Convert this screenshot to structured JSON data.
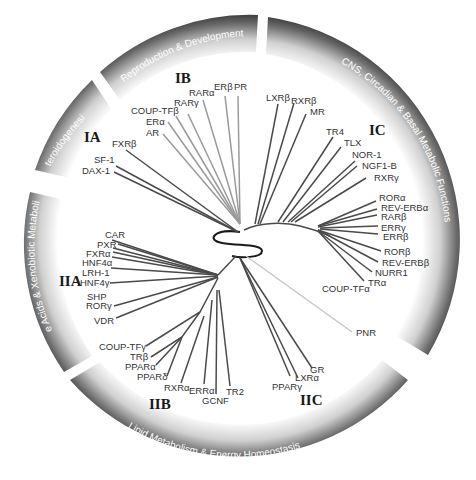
{
  "diagram": {
    "type": "phylogenetic-tree",
    "bands": [
      {
        "id": "steroidogenesis",
        "label": "Steroidogenesis"
      },
      {
        "id": "reproduction",
        "label": "Reproduction & Development"
      },
      {
        "id": "cns",
        "label": "CNS, Circadian & Basal Metabolic Functions"
      },
      {
        "id": "lipid",
        "label": "Lipid Metabolism & Energy Homeostasis"
      },
      {
        "id": "bile",
        "label": "Bile Acids & Xenobiotic Metabolism"
      }
    ],
    "clades": [
      {
        "id": "IA",
        "label": "IA"
      },
      {
        "id": "IB",
        "label": "IB"
      },
      {
        "id": "IC",
        "label": "IC"
      },
      {
        "id": "IIA",
        "label": "IIA"
      },
      {
        "id": "IIB",
        "label": "IIB"
      },
      {
        "id": "IIC",
        "label": "IIC"
      }
    ],
    "leaves": {
      "IA": [
        "FXRβ",
        "SF-1",
        "DAX-1"
      ],
      "IB": [
        "RARα",
        "ERβ",
        "PR",
        "RARγ",
        "COUP-TFβ",
        "ERα",
        "AR"
      ],
      "IC": [
        "LXRβ",
        "RXRβ",
        "MR",
        "TR4",
        "TLX",
        "NOR-1",
        "NGF1-B",
        "RXRγ",
        "RORα",
        "REV-ERBα",
        "RARβ",
        "ERRγ",
        "ERRβ",
        "RORβ",
        "REV-ERBβ",
        "NURR1",
        "TRα",
        "COUP-TFα"
      ],
      "IIA": [
        "CAR",
        "PXR",
        "FXRα",
        "HNF4α",
        "LRH-1",
        "HNF4γ",
        "SHP",
        "RORγ",
        "VDR"
      ],
      "IIB": [
        "COUP-TFγ",
        "TRβ",
        "PPARα",
        "PPARδ",
        "RXRα",
        "ERRα",
        "GCNF",
        "TR2"
      ],
      "IIC": [
        "PPARγ",
        "LXRα",
        "GR"
      ],
      "outgroup": [
        "PNR"
      ]
    },
    "colors": {
      "band_dark": "#3a3a3a",
      "band_light": "#ffffff",
      "branch_dark": "#4a4a4a",
      "branch_light": "#9a9a9a",
      "branch_pale": "#c4c4c4",
      "text": "#333333"
    }
  }
}
